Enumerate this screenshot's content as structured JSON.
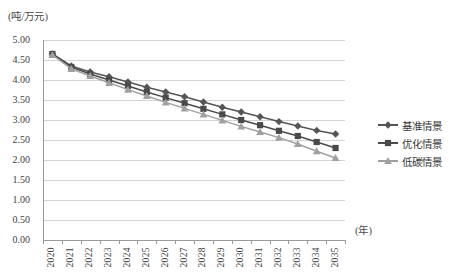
{
  "chart_data": {
    "type": "line",
    "title": "",
    "xlabel": "(年)",
    "ylabel": "(吨/万元)",
    "ylim": [
      0.0,
      5.0
    ],
    "ytick_step": 0.5,
    "grid": true,
    "legend_position": "right",
    "categories": [
      "2020",
      "2021",
      "2022",
      "2023",
      "2024",
      "2025",
      "2026",
      "2027",
      "2028",
      "2029",
      "2030",
      "2031",
      "2032",
      "2033",
      "2034",
      "2035"
    ],
    "ytick_labels": [
      "5.00",
      "4.50",
      "4.00",
      "3.50",
      "3.00",
      "2.50",
      "2.00",
      "1.50",
      "1.00",
      "0.50",
      "0.00"
    ],
    "series": [
      {
        "name": "基准情景",
        "marker": "diamond",
        "color": "#555555",
        "values": [
          4.65,
          4.35,
          4.2,
          4.08,
          3.95,
          3.82,
          3.7,
          3.58,
          3.45,
          3.32,
          3.2,
          3.08,
          2.96,
          2.85,
          2.74,
          2.65
        ]
      },
      {
        "name": "优化情景",
        "marker": "square",
        "color": "#4a4a4a",
        "values": [
          4.65,
          4.32,
          4.15,
          4.0,
          3.85,
          3.7,
          3.56,
          3.42,
          3.28,
          3.14,
          3.0,
          2.87,
          2.73,
          2.6,
          2.45,
          2.3
        ]
      },
      {
        "name": "低碳情景",
        "marker": "triangle",
        "color": "#a0a0a0",
        "values": [
          4.63,
          4.28,
          4.1,
          3.93,
          3.76,
          3.6,
          3.44,
          3.29,
          3.14,
          2.99,
          2.84,
          2.7,
          2.56,
          2.4,
          2.22,
          2.05
        ]
      }
    ]
  },
  "axes": {
    "y_unit_label": "(吨/万元)",
    "x_unit_label": "(年)"
  },
  "legend": {
    "items": [
      {
        "label": "基准情景"
      },
      {
        "label": "优化情景"
      },
      {
        "label": "低碳情景"
      }
    ]
  }
}
